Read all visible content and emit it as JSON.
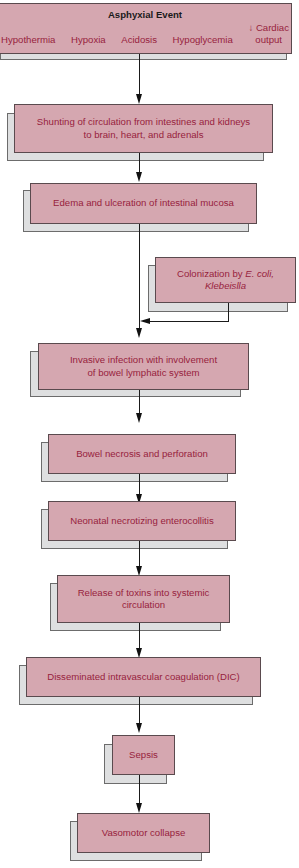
{
  "diagram": {
    "type": "flowchart",
    "colors": {
      "box_fill": "#d5a7b0",
      "box_text": "#97223d",
      "shadow_fill": "#dedfe0",
      "arrow": "#111111",
      "title_text": "#1a1a1a"
    },
    "top": {
      "title": "Asphyxial Event",
      "factors": [
        "Hypothermia",
        "Hypoxia",
        "Acidosis",
        "Hypoglycemia"
      ],
      "cardiac_line1": "↓ Cardiac",
      "cardiac_line2": "output"
    },
    "nodes": {
      "shunting": {
        "line1": "Shunting of circulation from intestines and kidneys",
        "line2": "to brain, heart, and adrenals"
      },
      "edema": {
        "label": "Edema and ulceration of intestinal mucosa"
      },
      "colonization": {
        "line1_prefix": "Colonization by ",
        "line1_italic": "E. coli,",
        "line2_italic": "Klebeislla"
      },
      "invasive": {
        "line1": "Invasive infection with involvement",
        "line2": "of bowel lymphatic system"
      },
      "necrosis": {
        "label": "Bowel necrosis and perforation"
      },
      "nec": {
        "label": "Neonatal necrotizing enterocollitis"
      },
      "toxins": {
        "line1": "Release of toxins into systemic",
        "line2": "circulation"
      },
      "dic": {
        "label": "Disseminated intravascular coagulation (DIC)"
      },
      "sepsis": {
        "label": "Sepsis"
      },
      "vasomotor": {
        "label": "Vasomotor collapse"
      }
    },
    "edges": [
      [
        "top",
        "shunting"
      ],
      [
        "shunting",
        "edema"
      ],
      [
        "edema",
        "invasive"
      ],
      [
        "colonization",
        "invasive"
      ],
      [
        "invasive",
        "necrosis"
      ],
      [
        "necrosis",
        "nec"
      ],
      [
        "nec",
        "toxins"
      ],
      [
        "toxins",
        "dic"
      ],
      [
        "dic",
        "sepsis"
      ],
      [
        "sepsis",
        "vasomotor"
      ]
    ]
  }
}
